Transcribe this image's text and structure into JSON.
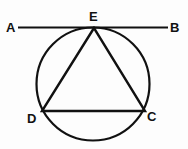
{
  "figure": {
    "kind": "geometry-diagram",
    "canvas": {
      "width": 188,
      "height": 149
    },
    "background_color": "#fdfdfd",
    "stroke_color": "#111111",
    "label_color": "#111111",
    "circle": {
      "cx": 93,
      "cy": 84,
      "r": 56.5,
      "stroke_width": 2.2
    },
    "tangent_line": {
      "name": "AB",
      "x1": 18,
      "y1": 27.5,
      "x2": 168,
      "y2": 27.5,
      "stroke_width": 2.2,
      "tangent_point": "E"
    },
    "triangle": {
      "name": "DEC",
      "stroke_width": 2.4,
      "points": "94,28 42,111 145,111",
      "vertices": [
        {
          "id": "E",
          "x": 94,
          "y": 28
        },
        {
          "id": "D",
          "x": 42,
          "y": 111
        },
        {
          "id": "C",
          "x": 145,
          "y": 111
        }
      ],
      "edges": [
        {
          "from": "E",
          "to": "D"
        },
        {
          "from": "D",
          "to": "C"
        },
        {
          "from": "C",
          "to": "E"
        }
      ]
    },
    "labels": [
      {
        "id": "A",
        "text": "A",
        "x": 11,
        "y": 27
      },
      {
        "id": "E",
        "text": "E",
        "x": 94,
        "y": 16
      },
      {
        "id": "B",
        "text": "B",
        "x": 174,
        "y": 27
      },
      {
        "id": "D",
        "text": "D",
        "x": 31,
        "y": 118
      },
      {
        "id": "C",
        "text": "C",
        "x": 151,
        "y": 116
      }
    ]
  }
}
